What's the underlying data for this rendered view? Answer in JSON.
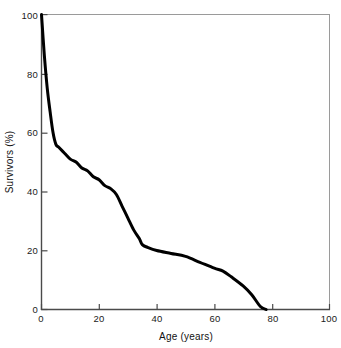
{
  "chart_data": {
    "type": "line",
    "title": "",
    "xlabel": "Age (years)",
    "ylabel": "Survivors (%)",
    "xlim": [
      0,
      100
    ],
    "ylim": [
      0,
      100
    ],
    "xticks": [
      0,
      20,
      40,
      60,
      80,
      100
    ],
    "yticks": [
      0,
      20,
      40,
      60,
      80,
      100
    ],
    "xtick_labels": [
      "0",
      "20",
      "40",
      "60",
      "80",
      "100"
    ],
    "ytick_labels": [
      "0",
      "20",
      "40",
      "60",
      "80",
      "100"
    ],
    "grid": false,
    "legend": null,
    "line_color": "#000000",
    "line_width": 3,
    "series": [
      {
        "name": "Survivorship",
        "x": [
          0,
          1,
          2,
          3,
          4,
          5,
          6,
          8,
          10,
          12,
          14,
          16,
          18,
          20,
          22,
          24,
          26,
          28,
          30,
          32,
          34,
          35,
          37,
          40,
          45,
          50,
          55,
          60,
          63,
          66,
          70,
          73,
          76,
          78
        ],
        "y": [
          100,
          86,
          75,
          67,
          60,
          56,
          55,
          53,
          51,
          50,
          48,
          47,
          45,
          44,
          42,
          41,
          39,
          35,
          31,
          27,
          24,
          22,
          21,
          20,
          19,
          18,
          16,
          14,
          13,
          11,
          8,
          5,
          1,
          0
        ]
      }
    ]
  },
  "axes": {
    "frame_color": "#3a3a3a",
    "background": "#ffffff"
  }
}
